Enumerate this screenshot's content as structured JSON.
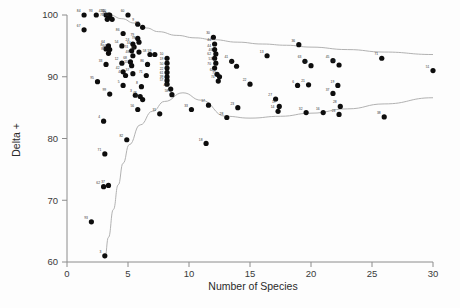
{
  "chart_data": {
    "type": "scatter",
    "title": "",
    "xlabel": "Number of Species",
    "ylabel": "Delta +",
    "xlim": [
      0,
      30
    ],
    "ylim": [
      60,
      100
    ],
    "xticks": [
      0,
      5,
      10,
      15,
      20,
      25,
      30
    ],
    "yticks": [
      60,
      70,
      80,
      90,
      100
    ],
    "xtick_labels": [
      "0",
      "5",
      "10",
      "15",
      "20",
      "25",
      "30"
    ],
    "ytick_labels": [
      "60",
      "70",
      "80",
      "90",
      "100"
    ],
    "grid": false,
    "legend": false,
    "marker": "filled-circle",
    "marker_color": "#0d0d0d",
    "points": [
      {
        "x": 1.4,
        "y": 100.0,
        "label": "84"
      },
      {
        "x": 2.4,
        "y": 100.0,
        "label": "93"
      },
      {
        "x": 3.2,
        "y": 100.0,
        "label": "43"
      },
      {
        "x": 3.4,
        "y": 100.0,
        "label": "15"
      },
      {
        "x": 3.5,
        "y": 100.0,
        "label": "60"
      },
      {
        "x": 3.5,
        "y": 99.7,
        "label": "44"
      },
      {
        "x": 3.3,
        "y": 99.3,
        "label": "76"
      },
      {
        "x": 3.7,
        "y": 99.3,
        "label": "90"
      },
      {
        "x": 5.0,
        "y": 100.0,
        "label": "60"
      },
      {
        "x": 1.4,
        "y": 97.6,
        "label": "67"
      },
      {
        "x": 5.8,
        "y": 98.5,
        "label": "9"
      },
      {
        "x": 6.2,
        "y": 98.0,
        "label": "83"
      },
      {
        "x": 4.6,
        "y": 97.0,
        "label": "86"
      },
      {
        "x": 5.8,
        "y": 96.2,
        "label": "79"
      },
      {
        "x": 5.9,
        "y": 95.6,
        "label": "78"
      },
      {
        "x": 5.4,
        "y": 95.3,
        "label": "24"
      },
      {
        "x": 5.5,
        "y": 94.8,
        "label": "34"
      },
      {
        "x": 3.4,
        "y": 95.0,
        "label": "64"
      },
      {
        "x": 4.5,
        "y": 95.0,
        "label": "54"
      },
      {
        "x": 3.2,
        "y": 94.5,
        "label": "8"
      },
      {
        "x": 3.5,
        "y": 94.4,
        "label": "64"
      },
      {
        "x": 3.4,
        "y": 93.8,
        "label": "85"
      },
      {
        "x": 5.3,
        "y": 94.2,
        "label": "74"
      },
      {
        "x": 5.9,
        "y": 94.0,
        "label": "81"
      },
      {
        "x": 5.4,
        "y": 93.4,
        "label": "48"
      },
      {
        "x": 6.8,
        "y": 93.6,
        "label": "58"
      },
      {
        "x": 7.2,
        "y": 93.6,
        "label": "59"
      },
      {
        "x": 12.0,
        "y": 96.4,
        "label": "30"
      },
      {
        "x": 12.1,
        "y": 95.3,
        "label": "44"
      },
      {
        "x": 12.1,
        "y": 94.4,
        "label": "44"
      },
      {
        "x": 12.2,
        "y": 93.7,
        "label": "46"
      },
      {
        "x": 12.1,
        "y": 93.0,
        "label": "62"
      },
      {
        "x": 19.0,
        "y": 95.2,
        "label": "36"
      },
      {
        "x": 4.5,
        "y": 92.2,
        "label": "12"
      },
      {
        "x": 3.2,
        "y": 92.0,
        "label": "33"
      },
      {
        "x": 5.2,
        "y": 92.4,
        "label": "68"
      },
      {
        "x": 5.3,
        "y": 91.8,
        "label": "55"
      },
      {
        "x": 6.6,
        "y": 92.0,
        "label": "86"
      },
      {
        "x": 8.2,
        "y": 93.0,
        "label": "10"
      },
      {
        "x": 8.2,
        "y": 92.2,
        "label": "19"
      },
      {
        "x": 8.2,
        "y": 91.4,
        "label": "50"
      },
      {
        "x": 8.2,
        "y": 90.7,
        "label": "22"
      },
      {
        "x": 12.2,
        "y": 92.2,
        "label": "53"
      },
      {
        "x": 12.1,
        "y": 91.4,
        "label": "70"
      },
      {
        "x": 13.5,
        "y": 92.5,
        "label": "41"
      },
      {
        "x": 13.9,
        "y": 91.7,
        "label": "42"
      },
      {
        "x": 16.4,
        "y": 93.4,
        "label": "13"
      },
      {
        "x": 19.5,
        "y": 92.5,
        "label": "63"
      },
      {
        "x": 20.0,
        "y": 91.8,
        "label": "14"
      },
      {
        "x": 21.8,
        "y": 92.6,
        "label": "45"
      },
      {
        "x": 22.3,
        "y": 91.9,
        "label": "68"
      },
      {
        "x": 25.8,
        "y": 93.0,
        "label": "71"
      },
      {
        "x": 4.6,
        "y": 90.8,
        "label": "42"
      },
      {
        "x": 4.8,
        "y": 90.2,
        "label": "47"
      },
      {
        "x": 5.4,
        "y": 90.5,
        "label": "37"
      },
      {
        "x": 6.5,
        "y": 90.2,
        "label": "71"
      },
      {
        "x": 8.2,
        "y": 90.0,
        "label": "61"
      },
      {
        "x": 8.2,
        "y": 89.4,
        "label": "39"
      },
      {
        "x": 8.2,
        "y": 88.8,
        "label": "57"
      },
      {
        "x": 12.3,
        "y": 90.4,
        "label": "62"
      },
      {
        "x": 12.5,
        "y": 90.0,
        "label": "73"
      },
      {
        "x": 12.4,
        "y": 89.3,
        "label": "74"
      },
      {
        "x": 2.5,
        "y": 89.2,
        "label": "95"
      },
      {
        "x": 4.6,
        "y": 88.6,
        "label": "5"
      },
      {
        "x": 6.1,
        "y": 88.4,
        "label": "8"
      },
      {
        "x": 15.0,
        "y": 88.8,
        "label": "22"
      },
      {
        "x": 18.9,
        "y": 88.6,
        "label": "6"
      },
      {
        "x": 19.8,
        "y": 88.7,
        "label": "21"
      },
      {
        "x": 22.2,
        "y": 88.6,
        "label": "19"
      },
      {
        "x": 3.5,
        "y": 87.2,
        "label": "99"
      },
      {
        "x": 5.6,
        "y": 87.0,
        "label": "3"
      },
      {
        "x": 6.0,
        "y": 86.8,
        "label": "48"
      },
      {
        "x": 6.2,
        "y": 86.3,
        "label": "95"
      },
      {
        "x": 8.5,
        "y": 88.0,
        "label": "47"
      },
      {
        "x": 8.6,
        "y": 87.1,
        "label": "58"
      },
      {
        "x": 21.8,
        "y": 87.3,
        "label": "37"
      },
      {
        "x": 5.8,
        "y": 84.7,
        "label": "56"
      },
      {
        "x": 7.6,
        "y": 84.0,
        "label": "31"
      },
      {
        "x": 10.2,
        "y": 84.7,
        "label": "33"
      },
      {
        "x": 11.6,
        "y": 85.4,
        "label": "17"
      },
      {
        "x": 14.0,
        "y": 85.0,
        "label": "23"
      },
      {
        "x": 17.1,
        "y": 86.4,
        "label": "27"
      },
      {
        "x": 17.4,
        "y": 85.2,
        "label": "19"
      },
      {
        "x": 17.3,
        "y": 84.4,
        "label": "14"
      },
      {
        "x": 13.1,
        "y": 83.4,
        "label": "28"
      },
      {
        "x": 19.6,
        "y": 84.2,
        "label": "32"
      },
      {
        "x": 21.0,
        "y": 84.2,
        "label": "16"
      },
      {
        "x": 22.4,
        "y": 85.2,
        "label": "28"
      },
      {
        "x": 22.3,
        "y": 83.9,
        "label": "23"
      },
      {
        "x": 26.0,
        "y": 83.5,
        "label": "38"
      },
      {
        "x": 30.0,
        "y": 91.0,
        "label": "51"
      },
      {
        "x": 4.9,
        "y": 79.8,
        "label": "82"
      },
      {
        "x": 11.4,
        "y": 79.2,
        "label": "18"
      },
      {
        "x": 3.0,
        "y": 82.8,
        "label": "4"
      },
      {
        "x": 3.1,
        "y": 77.5,
        "label": "71"
      },
      {
        "x": 3.0,
        "y": 72.2,
        "label": "62"
      },
      {
        "x": 3.4,
        "y": 72.4,
        "label": "37"
      },
      {
        "x": 2.0,
        "y": 66.5,
        "label": "93"
      },
      {
        "x": 3.1,
        "y": 61.0,
        "label": "3"
      }
    ],
    "funnel_upper": [
      {
        "x": 3.5,
        "y": 100.0
      },
      {
        "x": 4.5,
        "y": 99.4
      },
      {
        "x": 5.5,
        "y": 98.7
      },
      {
        "x": 6.5,
        "y": 97.9
      },
      {
        "x": 7.5,
        "y": 97.3
      },
      {
        "x": 9.0,
        "y": 96.7
      },
      {
        "x": 10.5,
        "y": 96.3
      },
      {
        "x": 12.0,
        "y": 96.0
      },
      {
        "x": 14.0,
        "y": 95.6
      },
      {
        "x": 16.0,
        "y": 95.3
      },
      {
        "x": 18.0,
        "y": 95.1
      },
      {
        "x": 20.0,
        "y": 94.8
      },
      {
        "x": 23.0,
        "y": 94.4
      },
      {
        "x": 26.0,
        "y": 94.0
      },
      {
        "x": 30.0,
        "y": 93.6
      }
    ],
    "funnel_lower": [
      {
        "x": 3.1,
        "y": 60.6
      },
      {
        "x": 3.4,
        "y": 64.0
      },
      {
        "x": 3.8,
        "y": 68.5
      },
      {
        "x": 4.2,
        "y": 72.5
      },
      {
        "x": 4.6,
        "y": 76.0
      },
      {
        "x": 5.1,
        "y": 79.0
      },
      {
        "x": 6.0,
        "y": 82.2
      },
      {
        "x": 7.0,
        "y": 84.4
      },
      {
        "x": 8.0,
        "y": 86.0
      },
      {
        "x": 9.5,
        "y": 87.4
      },
      {
        "x": 11.0,
        "y": 86.2
      },
      {
        "x": 13.0,
        "y": 83.6
      },
      {
        "x": 15.0,
        "y": 83.3
      },
      {
        "x": 17.5,
        "y": 83.6
      },
      {
        "x": 20.0,
        "y": 84.1
      },
      {
        "x": 23.0,
        "y": 84.8
      },
      {
        "x": 26.0,
        "y": 85.6
      },
      {
        "x": 30.0,
        "y": 86.6
      }
    ]
  }
}
